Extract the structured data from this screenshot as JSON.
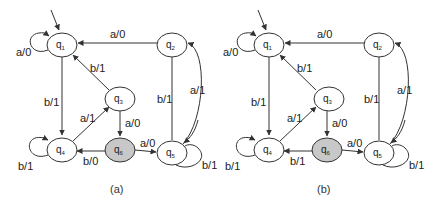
{
  "diagram": {
    "type": "finite-state-machine (Mealy)",
    "panels": [
      {
        "caption": "(a)",
        "states": [
          {
            "id": "q1",
            "label": "q",
            "sub": "1",
            "initial": true,
            "shaded": false
          },
          {
            "id": "q2",
            "label": "q",
            "sub": "2",
            "shaded": false
          },
          {
            "id": "q3",
            "label": "q",
            "sub": "3",
            "shaded": false
          },
          {
            "id": "q4",
            "label": "q",
            "sub": "4",
            "shaded": false
          },
          {
            "id": "q5",
            "label": "q",
            "sub": "5",
            "shaded": false
          },
          {
            "id": "q6",
            "label": "q",
            "sub": "6",
            "shaded": true
          }
        ],
        "transitions": [
          {
            "from": "q1",
            "to": "q1",
            "label": "a/0"
          },
          {
            "from": "q1",
            "to": "q4",
            "label": "b/1"
          },
          {
            "from": "q2",
            "to": "q1",
            "label": "a/0"
          },
          {
            "from": "q2",
            "to": "q5",
            "label": "b/1"
          },
          {
            "from": "q3",
            "to": "q1",
            "label": "b/1"
          },
          {
            "from": "q3",
            "to": "q6",
            "label": "a/0"
          },
          {
            "from": "q4",
            "to": "q4",
            "label": "b/1"
          },
          {
            "from": "q4",
            "to": "q3",
            "label": "a/1"
          },
          {
            "from": "q6",
            "to": "q4",
            "label": "b/0"
          },
          {
            "from": "q6",
            "to": "q5",
            "label": "a/0"
          },
          {
            "from": "q5",
            "to": "q5",
            "label": "b/1"
          },
          {
            "from": "q5",
            "to": "q2",
            "label": "a/1"
          }
        ]
      },
      {
        "caption": "(b)",
        "states": [
          {
            "id": "q1",
            "label": "q",
            "sub": "1",
            "initial": true,
            "shaded": false
          },
          {
            "id": "q2",
            "label": "q",
            "sub": "2",
            "shaded": false
          },
          {
            "id": "q3",
            "label": "q",
            "sub": "3",
            "shaded": false
          },
          {
            "id": "q4",
            "label": "q",
            "sub": "4",
            "shaded": false
          },
          {
            "id": "q5",
            "label": "q",
            "sub": "5",
            "shaded": false
          },
          {
            "id": "q6",
            "label": "q",
            "sub": "6",
            "shaded": true
          }
        ],
        "transitions": [
          {
            "from": "q1",
            "to": "q1",
            "label": "a/0"
          },
          {
            "from": "q1",
            "to": "q4",
            "label": "b/1"
          },
          {
            "from": "q2",
            "to": "q1",
            "label": "a/0"
          },
          {
            "from": "q2",
            "to": "q5",
            "label": "b/1"
          },
          {
            "from": "q3",
            "to": "q1",
            "label": "b/1"
          },
          {
            "from": "q3",
            "to": "q6",
            "label": "a/0"
          },
          {
            "from": "q4",
            "to": "q4",
            "label": "b/1"
          },
          {
            "from": "q4",
            "to": "q3",
            "label": "a/1"
          },
          {
            "from": "q6",
            "to": "q4",
            "label": "b/1"
          },
          {
            "from": "q6",
            "to": "q5",
            "label": "a/0"
          },
          {
            "from": "q5",
            "to": "q5",
            "label": "b/1"
          },
          {
            "from": "q5",
            "to": "q2",
            "label": "a/1"
          }
        ]
      }
    ],
    "colors": {
      "stroke": "#333333",
      "shaded_fill": "#c8c8c8",
      "background": "#ffffff"
    }
  }
}
